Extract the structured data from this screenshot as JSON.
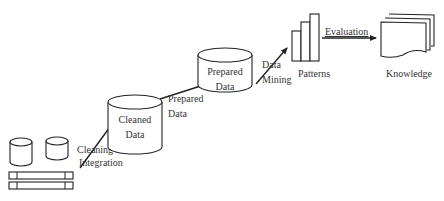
{
  "diagram": {
    "stages": {
      "sources": {
        "label": ""
      },
      "cleaned": {
        "line1": "Cleaned",
        "line2": "Data"
      },
      "prepared": {
        "line1": "Prepared",
        "line2": "Data"
      },
      "patterns": {
        "label": "Patterns"
      },
      "knowledge": {
        "label": "Knowledge"
      }
    },
    "steps": {
      "cleaning": {
        "line1": "Cleaning",
        "line2": "Integration"
      },
      "preparing": {
        "line1": "Prepared",
        "line2": "Data"
      },
      "mining": {
        "line1": "Data",
        "line2": "Mining"
      },
      "evaluation": {
        "label": "Evaluation"
      }
    },
    "colors": {
      "stroke": "#222222",
      "text": "#333333",
      "background": "#ffffff"
    }
  }
}
